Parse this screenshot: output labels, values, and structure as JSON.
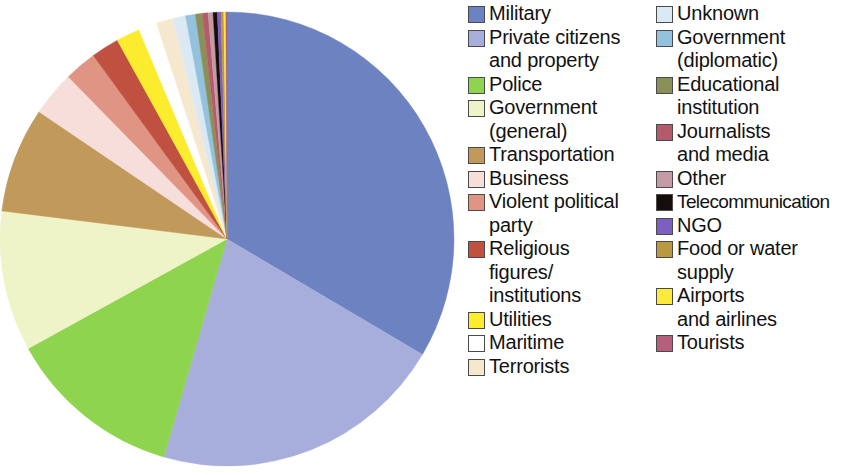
{
  "chart_data": {
    "type": "pie",
    "title": "",
    "subtitle": "",
    "xlabel": "",
    "ylabel": "",
    "legend_position": "right",
    "legend_columns": 2,
    "start_angle_deg": 0,
    "direction": "clockwise",
    "categories": [
      "Military",
      "Private citizens and property",
      "Police",
      "Government (general)",
      "Transportation",
      "Business",
      "Violent political party",
      "Religious figures/ institutions",
      "Utilities",
      "Maritime",
      "Terrorists",
      "Unknown",
      "Government (diplomatic)",
      "Educational institution",
      "Journalists and media",
      "Other",
      "Telecommunication",
      "NGO",
      "Food or water supply",
      "Airports and airlines",
      "Tourists"
    ],
    "values": [
      33.5,
      21.0,
      12.5,
      10.0,
      7.5,
      3.2,
      2.3,
      2.0,
      1.7,
      1.3,
      1.2,
      0.9,
      0.7,
      0.5,
      0.4,
      0.35,
      0.3,
      0.25,
      0.2,
      0.15,
      0.08
    ],
    "colors": [
      "#6C82C1",
      "#A8AEDB",
      "#8ED44F",
      "#EFF4C8",
      "#C19A5B",
      "#F6DEDA",
      "#E09484",
      "#C0503F",
      "#FCEC2E",
      "#FFFFFF",
      "#F6E8CE",
      "#DBEAF2",
      "#93C2DE",
      "#8A9057",
      "#B35A6B",
      "#C39AA6",
      "#140D0A",
      "#7C5FBE",
      "#B9983F",
      "#FBE93C",
      "#B4607C"
    ],
    "slices": [
      {
        "label": "Military",
        "value": 33.5,
        "color": "#6C82C1"
      },
      {
        "label": "Private citizens and property",
        "value": 21.0,
        "color": "#A8AEDB"
      },
      {
        "label": "Police",
        "value": 12.5,
        "color": "#8ED44F"
      },
      {
        "label": "Government (general)",
        "value": 10.0,
        "color": "#EFF4C8"
      },
      {
        "label": "Transportation",
        "value": 7.5,
        "color": "#C19A5B"
      },
      {
        "label": "Business",
        "value": 3.2,
        "color": "#F6DEDA"
      },
      {
        "label": "Violent political party",
        "value": 2.3,
        "color": "#E09484"
      },
      {
        "label": "Religious figures/institutions",
        "value": 2.0,
        "color": "#C0503F"
      },
      {
        "label": "Utilities",
        "value": 1.7,
        "color": "#FCEC2E"
      },
      {
        "label": "Maritime",
        "value": 1.3,
        "color": "#FFFFFF"
      },
      {
        "label": "Terrorists",
        "value": 1.2,
        "color": "#F6E8CE"
      },
      {
        "label": "Unknown",
        "value": 0.9,
        "color": "#DBEAF2"
      },
      {
        "label": "Government (diplomatic)",
        "value": 0.7,
        "color": "#93C2DE"
      },
      {
        "label": "Educational institution",
        "value": 0.5,
        "color": "#8A9057"
      },
      {
        "label": "Journalists and media",
        "value": 0.4,
        "color": "#B35A6B"
      },
      {
        "label": "Other",
        "value": 0.35,
        "color": "#C39AA6"
      },
      {
        "label": "Telecommunication",
        "value": 0.3,
        "color": "#140D0A"
      },
      {
        "label": "NGO",
        "value": 0.25,
        "color": "#7C5FBE"
      },
      {
        "label": "Food or water supply",
        "value": 0.2,
        "color": "#B9983F"
      },
      {
        "label": "Airports and airlines",
        "value": 0.15,
        "color": "#FBE93C"
      },
      {
        "label": "Tourists",
        "value": 0.08,
        "color": "#B4607C"
      }
    ]
  },
  "legend": {
    "column_left": [
      {
        "label": "Military",
        "color": "#6C82C1"
      },
      {
        "label": "Private citizens\nand property",
        "color": "#A8AEDB"
      },
      {
        "label": "Police",
        "color": "#8ED44F"
      },
      {
        "label": "Government\n(general)",
        "color": "#EFF4C8"
      },
      {
        "label": "Transportation",
        "color": "#C19A5B"
      },
      {
        "label": "Business",
        "color": "#F6DEDA"
      },
      {
        "label": "Violent political\nparty",
        "color": "#E09484"
      },
      {
        "label": "Religious\nfigures/\ninstitutions",
        "color": "#C0503F"
      },
      {
        "label": "Utilities",
        "color": "#FCEC2E"
      },
      {
        "label": "Maritime",
        "color": "#FFFFFF"
      },
      {
        "label": "Terrorists",
        "color": "#F6E8CE"
      }
    ],
    "column_right": [
      {
        "label": "Unknown",
        "color": "#DBEAF2"
      },
      {
        "label": "Government\n(diplomatic)",
        "color": "#93C2DE"
      },
      {
        "label": "Educational\ninstitution",
        "color": "#8A9057"
      },
      {
        "label": "Journalists\nand media",
        "color": "#B35A6B"
      },
      {
        "label": "Other",
        "color": "#C39AA6"
      },
      {
        "label": "Telecommunication",
        "color": "#140D0A"
      },
      {
        "label": "NGO",
        "color": "#7C5FBE"
      },
      {
        "label": "Food or water\nsupply",
        "color": "#B9983F"
      },
      {
        "label": "Airports\nand airlines",
        "color": "#FBE93C"
      },
      {
        "label": "Tourists",
        "color": "#B4607C"
      }
    ]
  }
}
